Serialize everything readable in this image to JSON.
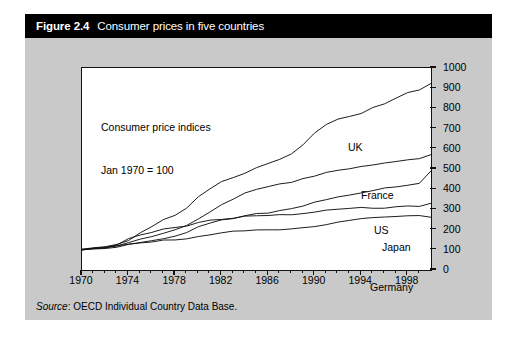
{
  "figure": {
    "number": "Figure 2.4",
    "title": "Consumer prices in five countries",
    "source_word": "Source",
    "source_text": ": OECD Individual Country Data Base."
  },
  "colors": {
    "title_bar_bg": "#000000",
    "title_bar_text": "#ffffff",
    "panel_bg": "#c9c9c9",
    "plot_bg": "#ffffff",
    "line": "#111111"
  },
  "chart_data": {
    "type": "line",
    "title": "Consumer prices in five countries",
    "annotation": "Consumer price indices\nJan 1970 = 100",
    "annotation_lines": [
      "Consumer price indices",
      "Jan 1970 = 100"
    ],
    "xlabel": "",
    "ylabel": "",
    "xlim": [
      1970,
      2000
    ],
    "ylim": [
      0,
      1000
    ],
    "grid": false,
    "legend_position": "inline-labels",
    "x_tick_labels": [
      "1970",
      "1974",
      "1978",
      "1982",
      "1986",
      "1990",
      "1994",
      "1998"
    ],
    "x_ticks": [
      1970,
      1974,
      1978,
      1982,
      1986,
      1990,
      1994,
      1998
    ],
    "x_minor_ticks": [
      1971,
      1972,
      1973,
      1975,
      1976,
      1977,
      1979,
      1980,
      1981,
      1983,
      1984,
      1985,
      1987,
      1988,
      1989,
      1991,
      1992,
      1993,
      1995,
      1996,
      1997,
      1999
    ],
    "y_tick_labels": [
      "0",
      "100",
      "200",
      "300",
      "400",
      "500",
      "600",
      "700",
      "800",
      "900",
      "1000"
    ],
    "y_ticks": [
      0,
      100,
      200,
      300,
      400,
      500,
      600,
      700,
      800,
      900,
      1000
    ],
    "x": [
      1970,
      1971,
      1972,
      1973,
      1974,
      1975,
      1976,
      1977,
      1978,
      1979,
      1980,
      1981,
      1982,
      1983,
      1984,
      1985,
      1986,
      1987,
      1988,
      1989,
      1990,
      1991,
      1992,
      1993,
      1994,
      1995,
      1996,
      1997,
      1998,
      1999,
      2000
    ],
    "series": [
      {
        "name": "UK",
        "label": "UK",
        "values": [
          100,
          109,
          117,
          128,
          148,
          184,
          215,
          249,
          269,
          305,
          360,
          403,
          437,
          457,
          480,
          509,
          527,
          548,
          576,
          621,
          680,
          719,
          746,
          758,
          777,
          804,
          823,
          849,
          878,
          891,
          925
        ]
      },
      {
        "name": "France",
        "label": "France",
        "values": [
          100,
          106,
          112,
          120,
          137,
          153,
          168,
          184,
          201,
          223,
          254,
          288,
          322,
          353,
          379,
          401,
          411,
          424,
          436,
          451,
          466,
          481,
          493,
          503,
          511,
          520,
          530,
          537,
          543,
          549,
          570
        ]
      },
      {
        "name": "US",
        "label": "US",
        "values": [
          100,
          104,
          108,
          114,
          127,
          138,
          146,
          156,
          168,
          187,
          212,
          234,
          248,
          256,
          267,
          277,
          282,
          292,
          304,
          319,
          336,
          350,
          361,
          372,
          381,
          392,
          404,
          413,
          419,
          428,
          490
        ]
      },
      {
        "name": "Japan",
        "label": "Japan",
        "values": [
          100,
          106,
          111,
          124,
          153,
          171,
          187,
          202,
          210,
          218,
          235,
          246,
          253,
          258,
          264,
          269,
          271,
          272,
          274,
          280,
          289,
          298,
          303,
          307,
          309,
          308,
          308,
          314,
          316,
          314,
          330
        ]
      },
      {
        "name": "Germany",
        "label": "Germany",
        "values": [
          100,
          105,
          111,
          119,
          127,
          135,
          141,
          146,
          150,
          156,
          165,
          176,
          185,
          191,
          196,
          200,
          200,
          201,
          203,
          209,
          215,
          223,
          235,
          245,
          252,
          257,
          261,
          266,
          268,
          270,
          262
        ]
      }
    ],
    "series_label_positions": [
      {
        "name": "UK",
        "x": 323,
        "y": 104
      },
      {
        "name": "France",
        "x": 336,
        "y": 152
      },
      {
        "name": "US",
        "x": 349,
        "y": 187
      },
      {
        "name": "Japan",
        "x": 357,
        "y": 204
      },
      {
        "name": "Germany",
        "x": 345,
        "y": 244
      }
    ]
  }
}
